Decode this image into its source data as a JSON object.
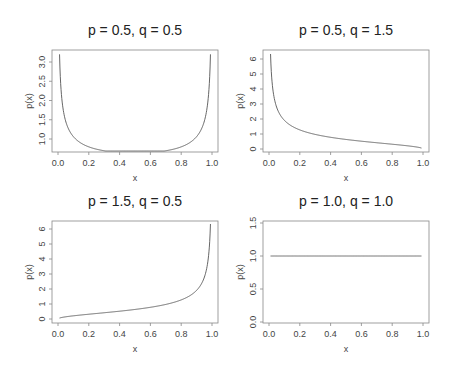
{
  "chart_data": [
    {
      "type": "line",
      "title": "p = 0.5, q = 0.5",
      "xlabel": "x",
      "ylabel": "p(x)",
      "xlim": [
        0.0,
        1.0
      ],
      "ylim": [
        0.64,
        3.2
      ],
      "xticks": [
        "0.0",
        "0.2",
        "0.4",
        "0.6",
        "0.8",
        "1.0"
      ],
      "yticks": [
        "1.0",
        "1.5",
        "2.0",
        "2.5",
        "3.0"
      ],
      "grid": false,
      "params": {
        "p": 0.5,
        "q": 0.5
      },
      "x": [
        0.01,
        0.02,
        0.05,
        0.1,
        0.2,
        0.3,
        0.4,
        0.5,
        0.6,
        0.7,
        0.8,
        0.9,
        0.95,
        0.98,
        0.99
      ],
      "y": [
        3.2,
        2.27,
        1.46,
        1.06,
        0.8,
        0.69,
        0.65,
        0.64,
        0.65,
        0.69,
        0.8,
        1.06,
        1.46,
        2.27,
        3.2
      ]
    },
    {
      "type": "line",
      "title": "p = 0.5, q = 1.5",
      "xlabel": "x",
      "ylabel": "p(x)",
      "xlim": [
        0.0,
        1.0
      ],
      "ylim": [
        0,
        6.4
      ],
      "xticks": [
        "0.0",
        "0.2",
        "0.4",
        "0.6",
        "0.8",
        "1.0"
      ],
      "yticks": [
        "0",
        "1",
        "2",
        "3",
        "4",
        "5",
        "6"
      ],
      "grid": false,
      "params": {
        "p": 0.5,
        "q": 1.5
      },
      "x": [
        0.01,
        0.02,
        0.05,
        0.1,
        0.2,
        0.3,
        0.4,
        0.5,
        0.6,
        0.7,
        0.8,
        0.9,
        0.99
      ],
      "y": [
        6.33,
        4.46,
        2.78,
        1.91,
        1.27,
        0.97,
        0.78,
        0.64,
        0.52,
        0.42,
        0.32,
        0.21,
        0.06
      ]
    },
    {
      "type": "line",
      "title": "p = 1.5, q = 0.5",
      "xlabel": "x",
      "ylabel": "p(x)",
      "xlim": [
        0.0,
        1.0
      ],
      "ylim": [
        0,
        6.4
      ],
      "xticks": [
        "0.0",
        "0.2",
        "0.4",
        "0.6",
        "0.8",
        "1.0"
      ],
      "yticks": [
        "0",
        "1",
        "2",
        "3",
        "4",
        "5",
        "6"
      ],
      "grid": false,
      "params": {
        "p": 1.5,
        "q": 0.5
      },
      "x": [
        0.01,
        0.1,
        0.2,
        0.3,
        0.4,
        0.5,
        0.6,
        0.7,
        0.8,
        0.9,
        0.95,
        0.98,
        0.99
      ],
      "y": [
        0.06,
        0.21,
        0.32,
        0.42,
        0.52,
        0.64,
        0.78,
        0.97,
        1.27,
        1.91,
        2.78,
        4.46,
        6.33
      ]
    },
    {
      "type": "line",
      "title": "p = 1.0, q = 1.0",
      "xlabel": "x",
      "ylabel": "p(x)",
      "xlim": [
        0.0,
        1.0
      ],
      "ylim": [
        0.0,
        1.5
      ],
      "xticks": [
        "0.0",
        "0.2",
        "0.4",
        "0.6",
        "0.8",
        "1.0"
      ],
      "yticks": [
        "0.0",
        "0.5",
        "1.0",
        "1.5"
      ],
      "grid": false,
      "params": {
        "p": 1.0,
        "q": 1.0
      },
      "x": [
        0.01,
        0.99
      ],
      "y": [
        1.0,
        1.0
      ]
    }
  ]
}
